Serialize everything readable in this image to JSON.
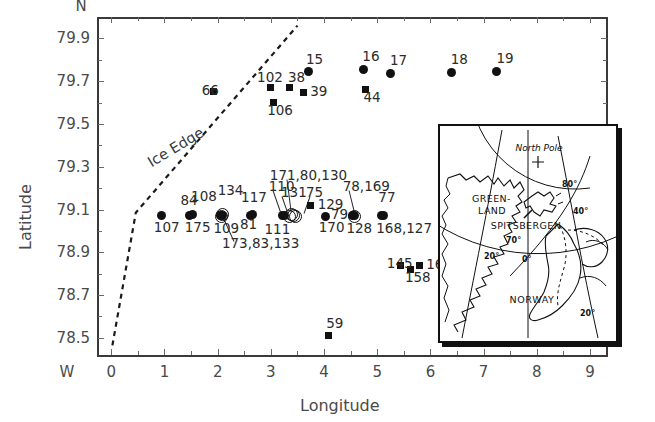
{
  "figure": {
    "axes": {
      "xlabel": "Longitude",
      "ylabel": "Latitude",
      "y_top_marker": "N",
      "x_left_marker": "W",
      "xticks": [
        "0",
        "1",
        "2",
        "3",
        "4",
        "5",
        "6",
        "7",
        "8",
        "9"
      ],
      "yticks": [
        "79.9",
        "79.7",
        "79.5",
        "79.3",
        "79.1",
        "78.9",
        "78.7",
        "78.5"
      ],
      "xlim": [
        -0.25,
        9.3
      ],
      "ylim": [
        78.42,
        80.0
      ]
    },
    "annotations": {
      "ice_edge_label": "Ice Edge"
    }
  },
  "chart_data": {
    "type": "scatter",
    "title": "",
    "xlabel": "Longitude",
    "ylabel": "Latitude",
    "xlim": [
      -0.25,
      9.3
    ],
    "ylim": [
      78.42,
      80.0
    ],
    "xticks": [
      0,
      1,
      2,
      3,
      4,
      5,
      6,
      7,
      8,
      9
    ],
    "yticks": [
      79.9,
      79.7,
      79.5,
      79.3,
      79.1,
      78.9,
      78.7,
      78.5
    ],
    "grid": false,
    "legend": null,
    "series": [
      {
        "name": "CTD stations (filled circle)",
        "marker": "filled-circle",
        "points": [
          {
            "label": "15",
            "x": 3.7,
            "y": 79.745
          },
          {
            "label": "16",
            "x": 4.75,
            "y": 79.755
          },
          {
            "label": "17",
            "x": 5.25,
            "y": 79.735
          },
          {
            "label": "18",
            "x": 6.4,
            "y": 79.74
          },
          {
            "label": "19",
            "x": 7.25,
            "y": 79.745
          },
          {
            "label": "107",
            "x": 0.95,
            "y": 79.073
          },
          {
            "label": "84,108,175",
            "x": 1.47,
            "y": 79.073
          },
          {
            "label": "134,109",
            "x": 2.05,
            "y": 79.07
          },
          {
            "label": "117,81",
            "x": 2.62,
            "y": 79.072
          },
          {
            "label": "111,131",
            "x": 3.22,
            "y": 79.07
          },
          {
            "label": "170,79",
            "x": 4.02,
            "y": 79.068
          },
          {
            "label": "128,78,169",
            "x": 4.53,
            "y": 79.07
          },
          {
            "label": "77,168,127",
            "x": 5.08,
            "y": 79.07
          }
        ]
      },
      {
        "name": "Stations (filled square)",
        "marker": "filled-square",
        "points": [
          {
            "label": "66",
            "x": 1.93,
            "y": 79.652
          },
          {
            "label": "102",
            "x": 3.0,
            "y": 79.672
          },
          {
            "label": "106",
            "x": 3.04,
            "y": 79.6
          },
          {
            "label": "38",
            "x": 3.35,
            "y": 79.672
          },
          {
            "label": "39",
            "x": 3.62,
            "y": 79.648
          },
          {
            "label": "44",
            "x": 4.77,
            "y": 79.662
          },
          {
            "label": "75",
            "x": 3.75,
            "y": 79.118
          },
          {
            "label": "129",
            "x": 3.75,
            "y": 79.118
          },
          {
            "label": "145",
            "x": 5.43,
            "y": 78.838
          },
          {
            "label": "158",
            "x": 5.62,
            "y": 78.82
          },
          {
            "label": "166",
            "x": 5.8,
            "y": 78.838
          },
          {
            "label": "59",
            "x": 4.08,
            "y": 78.512
          }
        ]
      },
      {
        "name": "Stations (open circle)",
        "marker": "open-circle",
        "points": [
          {
            "label": "173,83,133",
            "x": 2.05,
            "y": 79.07
          },
          {
            "label": "171,80,130",
            "x": 3.33,
            "y": 79.072
          },
          {
            "label": "171,80,130b",
            "x": 3.4,
            "y": 79.078
          }
        ]
      }
    ],
    "point_labels": [
      {
        "text": "15",
        "x": 3.66,
        "y": 79.8
      },
      {
        "text": "16",
        "x": 4.72,
        "y": 79.812
      },
      {
        "text": "17",
        "x": 5.24,
        "y": 79.795
      },
      {
        "text": "18",
        "x": 6.38,
        "y": 79.8
      },
      {
        "text": "19",
        "x": 7.24,
        "y": 79.803
      },
      {
        "text": "66",
        "x": 1.7,
        "y": 79.652
      },
      {
        "text": "102",
        "x": 2.74,
        "y": 79.715
      },
      {
        "text": "106",
        "x": 2.93,
        "y": 79.562
      },
      {
        "text": "38",
        "x": 3.32,
        "y": 79.716
      },
      {
        "text": "39",
        "x": 3.74,
        "y": 79.648
      },
      {
        "text": "44",
        "x": 4.74,
        "y": 79.62
      },
      {
        "text": "171,80,130",
        "x": 2.98,
        "y": 79.258
      },
      {
        "text": "110",
        "x": 2.96,
        "y": 79.205
      },
      {
        "text": "134",
        "x": 2.0,
        "y": 79.185
      },
      {
        "text": "117",
        "x": 2.44,
        "y": 79.152
      },
      {
        "text": "131",
        "x": 3.19,
        "y": 79.176
      },
      {
        "text": "75",
        "x": 3.66,
        "y": 79.178
      },
      {
        "text": "78,169",
        "x": 4.35,
        "y": 79.205
      },
      {
        "text": "84",
        "x": 1.3,
        "y": 79.14
      },
      {
        "text": "108",
        "x": 1.5,
        "y": 79.158
      },
      {
        "text": "129",
        "x": 3.88,
        "y": 79.12
      },
      {
        "text": "77",
        "x": 5.02,
        "y": 79.155
      },
      {
        "text": "79",
        "x": 4.13,
        "y": 79.075
      },
      {
        "text": "107",
        "x": 0.8,
        "y": 79.012
      },
      {
        "text": "175",
        "x": 1.38,
        "y": 79.012
      },
      {
        "text": "109",
        "x": 1.92,
        "y": 79.01
      },
      {
        "text": "81",
        "x": 2.42,
        "y": 79.028
      },
      {
        "text": "111",
        "x": 2.88,
        "y": 79.002
      },
      {
        "text": "170",
        "x": 3.9,
        "y": 79.012
      },
      {
        "text": "128",
        "x": 4.42,
        "y": 79.008
      },
      {
        "text": "168,127",
        "x": 4.98,
        "y": 79.01
      },
      {
        "text": "173,83,133",
        "x": 2.08,
        "y": 78.938
      },
      {
        "text": "145",
        "x": 5.18,
        "y": 78.845
      },
      {
        "text": "158",
        "x": 5.52,
        "y": 78.782
      },
      {
        "text": "166",
        "x": 5.92,
        "y": 78.84
      },
      {
        "text": "59",
        "x": 4.04,
        "y": 78.565
      }
    ],
    "ice_edge": {
      "label": "Ice Edge",
      "style": "dashed",
      "vertices": [
        {
          "x": 0.02,
          "y": 78.465
        },
        {
          "x": 0.46,
          "y": 79.085
        },
        {
          "x": 3.5,
          "y": 79.96
        }
      ]
    }
  },
  "inset": {
    "labels": {
      "north_pole": "North Pole",
      "greenland_line1": "GREEN-",
      "greenland_line2": "LAND",
      "spitsbergen": "SPITSBERGEN",
      "norway": "NORWAY",
      "lat80": "80°",
      "lat70": "70°",
      "lon40": "40°",
      "lon20w": "20°",
      "lon0": "0°",
      "lon20e": "20°"
    }
  }
}
